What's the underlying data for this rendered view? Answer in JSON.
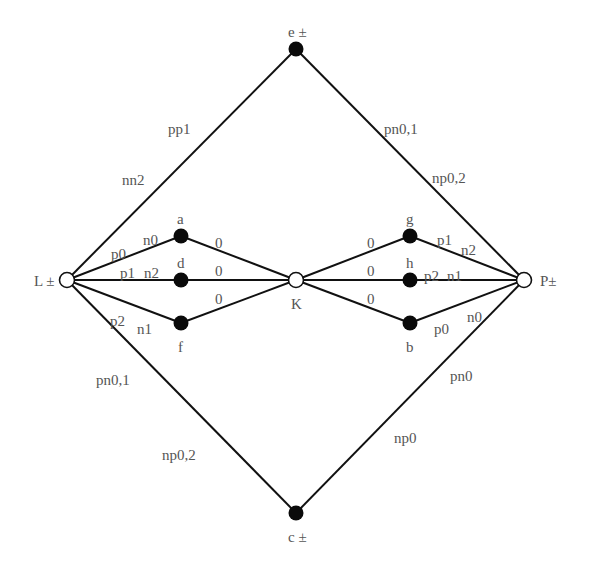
{
  "diagram": {
    "nodes": [
      {
        "id": "L",
        "label": "L ±",
        "x": 67,
        "y": 280,
        "style": "open",
        "lx": 34,
        "ly": 286
      },
      {
        "id": "P",
        "label": "P±",
        "x": 524,
        "y": 280,
        "style": "open",
        "lx": 540,
        "ly": 286
      },
      {
        "id": "K",
        "label": "K",
        "x": 296,
        "y": 280,
        "style": "open",
        "lx": 291,
        "ly": 309
      },
      {
        "id": "e",
        "label": "e ±",
        "x": 296,
        "y": 49,
        "style": "filled",
        "lx": 288,
        "ly": 37
      },
      {
        "id": "c",
        "label": "c ±",
        "x": 296,
        "y": 513,
        "style": "filled",
        "lx": 288,
        "ly": 542
      },
      {
        "id": "a",
        "label": "a",
        "x": 181,
        "y": 236,
        "style": "filled",
        "lx": 177,
        "ly": 224
      },
      {
        "id": "d",
        "label": "d",
        "x": 181,
        "y": 280,
        "style": "filled",
        "lx": 177,
        "ly": 268
      },
      {
        "id": "f",
        "label": "f",
        "x": 181,
        "y": 323,
        "style": "filled",
        "lx": 178,
        "ly": 352
      },
      {
        "id": "g",
        "label": "g",
        "x": 410,
        "y": 236,
        "style": "filled",
        "lx": 406,
        "ly": 224
      },
      {
        "id": "h",
        "label": "h",
        "x": 410,
        "y": 280,
        "style": "filled",
        "lx": 406,
        "ly": 268
      },
      {
        "id": "b",
        "label": "b",
        "x": 410,
        "y": 323,
        "style": "filled",
        "lx": 406,
        "ly": 352
      }
    ],
    "edges": [
      {
        "from": "L",
        "to": "e"
      },
      {
        "from": "e",
        "to": "P"
      },
      {
        "from": "L",
        "to": "c"
      },
      {
        "from": "c",
        "to": "P"
      },
      {
        "from": "L",
        "to": "a"
      },
      {
        "from": "L",
        "to": "d"
      },
      {
        "from": "L",
        "to": "f"
      },
      {
        "from": "a",
        "to": "K"
      },
      {
        "from": "d",
        "to": "K"
      },
      {
        "from": "f",
        "to": "K"
      },
      {
        "from": "K",
        "to": "g"
      },
      {
        "from": "K",
        "to": "h"
      },
      {
        "from": "K",
        "to": "b"
      },
      {
        "from": "g",
        "to": "P"
      },
      {
        "from": "h",
        "to": "P"
      },
      {
        "from": "b",
        "to": "P"
      }
    ],
    "edge_labels": [
      {
        "text": "pp1",
        "x": 168,
        "y": 134
      },
      {
        "text": "nn2",
        "x": 122,
        "y": 185
      },
      {
        "text": "pn0,1",
        "x": 384,
        "y": 134
      },
      {
        "text": "np0,2",
        "x": 432,
        "y": 183
      },
      {
        "text": "pn0,1",
        "x": 96,
        "y": 385
      },
      {
        "text": "np0,2",
        "x": 162,
        "y": 460
      },
      {
        "text": "pn0",
        "x": 450,
        "y": 381
      },
      {
        "text": "np0",
        "x": 394,
        "y": 443
      },
      {
        "text": "p0",
        "x": 111,
        "y": 259
      },
      {
        "text": "n0",
        "x": 143,
        "y": 245
      },
      {
        "text": "p1",
        "x": 120,
        "y": 278
      },
      {
        "text": "n2",
        "x": 144,
        "y": 278
      },
      {
        "text": "p2",
        "x": 110,
        "y": 326
      },
      {
        "text": "n1",
        "x": 137,
        "y": 334
      },
      {
        "text": "0",
        "x": 215,
        "y": 248
      },
      {
        "text": "0",
        "x": 215,
        "y": 276
      },
      {
        "text": "0",
        "x": 215,
        "y": 304
      },
      {
        "text": "0",
        "x": 367,
        "y": 248
      },
      {
        "text": "0",
        "x": 367,
        "y": 276
      },
      {
        "text": "0",
        "x": 367,
        "y": 304
      },
      {
        "text": "p1",
        "x": 437,
        "y": 245
      },
      {
        "text": "n2",
        "x": 461,
        "y": 255
      },
      {
        "text": "p2",
        "x": 424,
        "y": 281
      },
      {
        "text": "n1",
        "x": 447,
        "y": 281
      },
      {
        "text": "p0",
        "x": 434,
        "y": 334
      },
      {
        "text": "n0",
        "x": 467,
        "y": 322
      }
    ]
  },
  "colors": {
    "line": "#111111",
    "filled_node": "#0a0a0a",
    "open_node_fill": "#ffffff",
    "label": "#555555"
  }
}
